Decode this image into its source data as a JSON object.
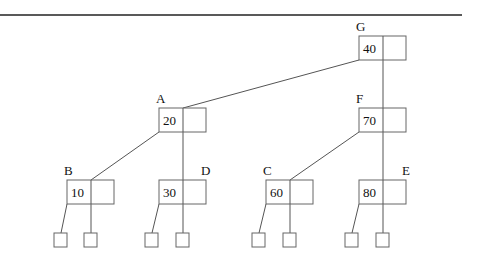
{
  "diagram": {
    "type": "tree",
    "nodes": [
      {
        "id": "G",
        "label": "G",
        "key": "40",
        "x": 359,
        "y": 36
      },
      {
        "id": "A",
        "label": "A",
        "key": "20",
        "x": 159,
        "y": 108
      },
      {
        "id": "F",
        "label": "F",
        "key": "70",
        "x": 359,
        "y": 108
      },
      {
        "id": "B",
        "label": "B",
        "key": "10",
        "x": 67,
        "y": 180
      },
      {
        "id": "D",
        "label": "D",
        "key": "30",
        "x": 159,
        "y": 180
      },
      {
        "id": "C",
        "label": "C",
        "key": "60",
        "x": 266,
        "y": 180
      },
      {
        "id": "E",
        "label": "E",
        "key": "80",
        "x": 359,
        "y": 180
      }
    ],
    "edges": [
      {
        "from": "G",
        "to": "A"
      },
      {
        "from": "G",
        "to": "F"
      },
      {
        "from": "A",
        "to": "B"
      },
      {
        "from": "A",
        "to": "D"
      },
      {
        "from": "F",
        "to": "C"
      },
      {
        "from": "F",
        "to": "E"
      }
    ],
    "leaf_count": 8
  }
}
